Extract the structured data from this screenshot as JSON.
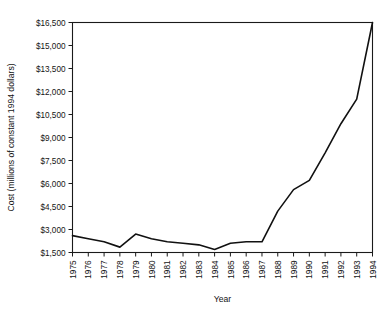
{
  "chart_data": {
    "type": "line",
    "title": "",
    "xlabel": "Year",
    "ylabel": "Cost (millions of constant 1994 dollars)",
    "x": [
      1975,
      1976,
      1977,
      1978,
      1979,
      1980,
      1981,
      1982,
      1983,
      1984,
      1985,
      1986,
      1987,
      1988,
      1989,
      1990,
      1991,
      1992,
      1993,
      1994
    ],
    "values": [
      2600,
      2400,
      2200,
      1850,
      2700,
      2400,
      2200,
      2100,
      2000,
      1700,
      2100,
      2200,
      2200,
      4200,
      5600,
      6200,
      8000,
      9900,
      11500,
      16500
    ],
    "series": [
      {
        "name": "Cost",
        "values": [
          2600,
          2400,
          2200,
          1850,
          2700,
          2400,
          2200,
          2100,
          2000,
          1700,
          2100,
          2200,
          2200,
          4200,
          5600,
          6200,
          8000,
          9900,
          11500,
          16500
        ]
      }
    ],
    "categories": [
      "1975",
      "1976",
      "1977",
      "1978",
      "1979",
      "1980",
      "1981",
      "1982",
      "1983",
      "1984",
      "1985",
      "1986",
      "1987",
      "1988",
      "1989",
      "1990",
      "1991",
      "1992",
      "1993",
      "1994"
    ],
    "xtick_labels": [
      "1975",
      "1976",
      "1977",
      "1978",
      "1979",
      "1980",
      "1981",
      "1982",
      "1983",
      "1984",
      "1985",
      "1986",
      "1987",
      "1988",
      "1989",
      "1990",
      "1991",
      "1992",
      "1993",
      "1994"
    ],
    "ytick_labels": [
      "$1,500",
      "$3,000",
      "$4,500",
      "$6,000",
      "$7,500",
      "$9,000",
      "$10,500",
      "$12,000",
      "$13,500",
      "$15,000",
      "$16,500"
    ],
    "ytick_values": [
      1500,
      3000,
      4500,
      6000,
      7500,
      9000,
      10500,
      12000,
      13500,
      15000,
      16500
    ],
    "ylim": [
      1500,
      16500
    ],
    "xlim": [
      1975,
      1994
    ],
    "grid": false,
    "legend": "none",
    "line_color": "#111111",
    "axis_color": "#1a1a1a",
    "background_color": "#ffffff"
  }
}
